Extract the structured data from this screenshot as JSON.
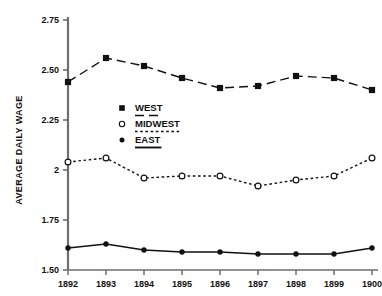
{
  "chart_data": {
    "type": "line",
    "title": "",
    "xlabel": "",
    "ylabel": "AVERAGE DAILY WAGE",
    "categories": [
      "1892",
      "1893",
      "1894",
      "1895",
      "1896",
      "1897",
      "1898",
      "1899",
      "1900"
    ],
    "x": [
      1892,
      1893,
      1894,
      1895,
      1896,
      1897,
      1898,
      1899,
      1900
    ],
    "xlim": [
      1892,
      1900
    ],
    "ylim": [
      1.5,
      2.75
    ],
    "yticks": [
      1.5,
      1.75,
      2.0,
      2.25,
      2.5,
      2.75
    ],
    "ytick_labels": [
      "1.50",
      "1.75",
      "2",
      "2.25",
      "2.50",
      "2.75"
    ],
    "grid": false,
    "legend_position": "center-left",
    "series": [
      {
        "name": "WEST",
        "marker": "filled-square",
        "line_style": "dashed",
        "color": "#111111",
        "values": [
          2.44,
          2.56,
          2.52,
          2.46,
          2.41,
          2.42,
          2.47,
          2.46,
          2.4
        ]
      },
      {
        "name": "MIDWEST",
        "marker": "open-circle",
        "line_style": "dotted",
        "color": "#111111",
        "values": [
          2.04,
          2.06,
          1.96,
          1.97,
          1.97,
          1.92,
          1.95,
          1.97,
          2.06
        ]
      },
      {
        "name": "EAST",
        "marker": "filled-circle",
        "line_style": "solid",
        "color": "#111111",
        "values": [
          1.61,
          1.63,
          1.6,
          1.59,
          1.59,
          1.58,
          1.58,
          1.58,
          1.61
        ]
      }
    ]
  },
  "legend": {
    "entries": [
      {
        "label": "WEST",
        "marker": "filled-square",
        "line_style": "dashed"
      },
      {
        "label": "MIDWEST",
        "marker": "open-circle",
        "line_style": "dotted"
      },
      {
        "label": "EAST",
        "marker": "filled-circle",
        "line_style": "solid"
      }
    ]
  },
  "axis": {
    "y_title": "AVERAGE DAILY WAGE",
    "y_tick_labels": [
      "2.75",
      "2.50",
      "2.25",
      "2",
      "1.75",
      "1.50"
    ],
    "x_tick_labels": [
      "1892",
      "1893",
      "1894",
      "1895",
      "1896",
      "1897",
      "1898",
      "1899",
      "1900"
    ]
  },
  "colors": {
    "ink": "#111111",
    "axis": "#6e6e6e",
    "background": "#ffffff"
  }
}
